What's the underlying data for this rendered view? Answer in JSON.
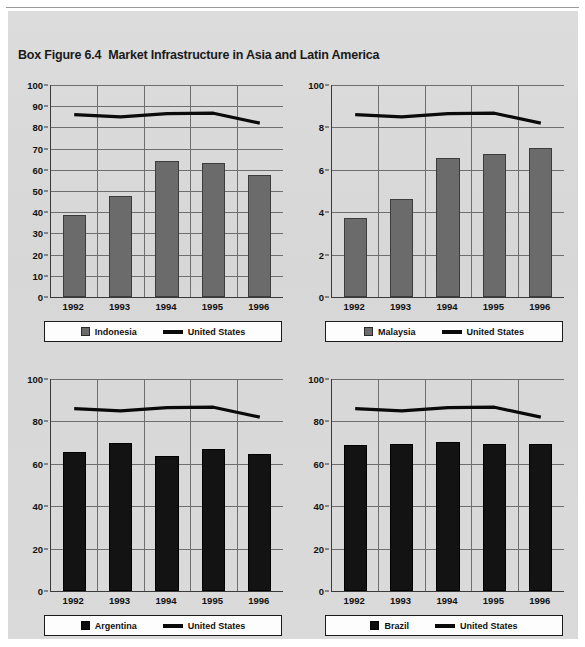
{
  "figure": {
    "label": "Box Figure 6.4",
    "title": "Market Infrastructure in Asia and Latin America",
    "background_color": "#d9d9d9",
    "bar_gray_color": "#6b6b6b",
    "bar_black_color": "#131313",
    "line_color": "#0a0a0a"
  },
  "chart_data": [
    {
      "type": "bar",
      "title": "Indonesia",
      "panel": "top-left",
      "categories": [
        "1992",
        "1993",
        "1994",
        "1995",
        "1996"
      ],
      "xlabel": "",
      "ylabel": "",
      "ylim": [
        0,
        100
      ],
      "yticks": [
        0,
        10,
        20,
        30,
        40,
        50,
        60,
        70,
        80,
        90,
        100
      ],
      "ytick_labels": [
        "0",
        "10",
        "20",
        "30",
        "40",
        "50",
        "60",
        "70",
        "80",
        "90",
        "100"
      ],
      "grid": true,
      "legend_position": "bottom",
      "series": [
        {
          "name": "Indonesia",
          "kind": "bar",
          "color": "#6b6b6b",
          "values": [
            38.5,
            47.5,
            64.0,
            63.0,
            57.5
          ]
        },
        {
          "name": "United States",
          "kind": "line",
          "color": "#0a0a0a",
          "values": [
            86.0,
            85.0,
            86.5,
            86.7,
            82.0
          ]
        }
      ]
    },
    {
      "type": "bar",
      "title": "Malaysia",
      "panel": "top-right",
      "categories": [
        "1992",
        "1993",
        "1994",
        "1995",
        "1996"
      ],
      "xlabel": "",
      "ylabel": "",
      "ylim": [
        0,
        10
      ],
      "yticks": [
        0,
        2,
        4,
        6,
        8,
        10
      ],
      "ytick_labels": [
        "0",
        "2",
        "4",
        "6",
        "8",
        "100"
      ],
      "grid": true,
      "legend_position": "bottom",
      "series": [
        {
          "name": "Malaysia",
          "kind": "bar",
          "color": "#6b6b6b",
          "values": [
            3.72,
            4.6,
            6.58,
            6.75,
            7.02
          ]
        },
        {
          "name": "United States",
          "kind": "line",
          "color": "#0a0a0a",
          "values": [
            8.6,
            8.5,
            8.65,
            8.67,
            8.2
          ]
        }
      ]
    },
    {
      "type": "bar",
      "title": "Argentina",
      "panel": "bottom-left",
      "categories": [
        "1992",
        "1993",
        "1994",
        "1995",
        "1996"
      ],
      "xlabel": "",
      "ylabel": "",
      "ylim": [
        0,
        100
      ],
      "yticks": [
        0,
        20,
        40,
        60,
        80,
        100
      ],
      "ytick_labels": [
        "0",
        "20",
        "40",
        "60",
        "80",
        "100"
      ],
      "grid": true,
      "legend_position": "bottom",
      "series": [
        {
          "name": "Argentina",
          "kind": "bar",
          "color": "#131313",
          "values": [
            65.5,
            70.0,
            63.5,
            67.0,
            64.5
          ]
        },
        {
          "name": "United States",
          "kind": "line",
          "color": "#0a0a0a",
          "values": [
            86.0,
            85.0,
            86.5,
            86.7,
            82.0
          ]
        }
      ]
    },
    {
      "type": "bar",
      "title": "Brazil",
      "panel": "bottom-right",
      "categories": [
        "1992",
        "1993",
        "1994",
        "1995",
        "1996"
      ],
      "xlabel": "",
      "ylabel": "",
      "ylim": [
        0,
        100
      ],
      "yticks": [
        0,
        20,
        40,
        60,
        80,
        100
      ],
      "ytick_labels": [
        "0",
        "20",
        "40",
        "60",
        "80",
        "100"
      ],
      "grid": true,
      "legend_position": "bottom",
      "series": [
        {
          "name": "Brazil",
          "kind": "bar",
          "color": "#131313",
          "values": [
            69.0,
            69.3,
            70.2,
            69.2,
            69.3
          ]
        },
        {
          "name": "United States",
          "kind": "line",
          "color": "#0a0a0a",
          "values": [
            86.0,
            85.0,
            86.5,
            86.7,
            82.0
          ]
        }
      ]
    }
  ]
}
